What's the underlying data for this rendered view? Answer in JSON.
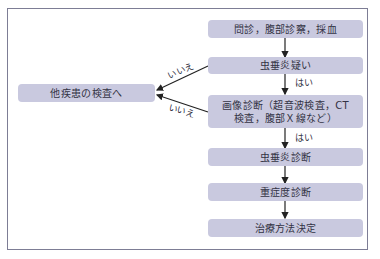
{
  "diagram": {
    "type": "flowchart",
    "nodes": [
      {
        "id": "n1",
        "label": "問診，腹部診察，採血"
      },
      {
        "id": "n2",
        "label": "虫垂炎疑い"
      },
      {
        "id": "n3",
        "label_line1": "画像診断（超音波検査，CT",
        "label_line2": "検査，腹部Ｘ線など）"
      },
      {
        "id": "n4",
        "label": "虫垂炎診断"
      },
      {
        "id": "n5",
        "label": "重症度診断"
      },
      {
        "id": "n6",
        "label": "治療方法決定"
      },
      {
        "id": "n7",
        "label": "他疾患の検査へ"
      }
    ],
    "edges": [
      {
        "from": "n1",
        "to": "n2",
        "label": ""
      },
      {
        "from": "n2",
        "to": "n3",
        "label": "はい"
      },
      {
        "from": "n3",
        "to": "n4",
        "label": "はい"
      },
      {
        "from": "n4",
        "to": "n5",
        "label": ""
      },
      {
        "from": "n5",
        "to": "n6",
        "label": ""
      },
      {
        "from": "n2",
        "to": "n7",
        "label": "いいえ"
      },
      {
        "from": "n3",
        "to": "n7",
        "label": "いいえ"
      }
    ],
    "edge_labels": {
      "yes1": "はい",
      "yes2": "はい",
      "no1": "いいえ",
      "no2": "いいえ"
    },
    "colors": {
      "box_fill": "#c9c9df",
      "frame": "#7d7d95",
      "text": "#333344",
      "arrow": "#222222"
    }
  }
}
